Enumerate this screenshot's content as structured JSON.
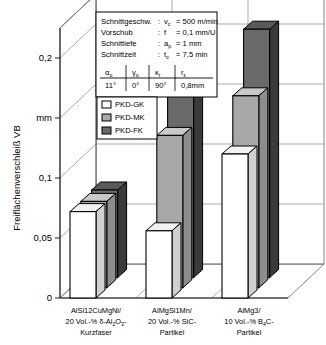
{
  "axes": {
    "y_axis_label": "Freiflächenverschleiß VB",
    "y_unit": "mm",
    "y_ticks": [
      "0",
      "0,05",
      "0,1",
      "mm",
      "0,2"
    ],
    "y_tick_values": [
      0,
      0.05,
      0.1,
      0.15,
      0.2
    ],
    "y_min": 0,
    "y_max": 0.225
  },
  "params_box": {
    "rows": [
      {
        "name": "Schnittgeschw.",
        "sep": ":",
        "sym": "v",
        "sym_sub": "c",
        "value": "= 500 m/min"
      },
      {
        "name": "Vorschub",
        "sep": ":",
        "sym": "f",
        "sym_sub": "",
        "value": "= 0,1 mm/U"
      },
      {
        "name": "Schnittiefe",
        "sep": ":",
        "sym": "a",
        "sym_sub": "p",
        "value": "= 1 mm"
      },
      {
        "name": "Schnittzeit",
        "sep": ":",
        "sym": "t",
        "sym_sub": "c",
        "value": "= 7,5 min"
      }
    ],
    "tool_table": {
      "headers": [
        {
          "sym": "α",
          "sub": "o"
        },
        {
          "sym": "γ",
          "sub": "o"
        },
        {
          "sym": "κ",
          "sub": "r"
        },
        {
          "sym": "r",
          "sub": "ε"
        }
      ],
      "values": [
        "11°",
        "0°",
        "90°",
        "0,8mm"
      ]
    }
  },
  "legend": {
    "items": [
      {
        "label": "PKD-GK",
        "color": "#ffffff"
      },
      {
        "label": "PKD-MK",
        "color": "#a8a8a8"
      },
      {
        "label": "PKD-FK",
        "color": "#6a6a6a"
      }
    ]
  },
  "chart_data": {
    "type": "bar",
    "title": "",
    "xlabel": "",
    "ylabel": "Freiflächenverschleiß VB",
    "yunit": "mm",
    "ylim": [
      0,
      0.225
    ],
    "grid": true,
    "legend_position": "upper-left-inset",
    "categories": [
      "AlSi12CuMgNi/ 20 Vol.-% δ-Al2O3- Kurzfaser",
      "AlMgSi1Mn/ 20 Vol.-% SiC- Partikel",
      "AlMg3/ 10 Vol.-% B4C- Partikel"
    ],
    "series": [
      {
        "name": "PKD-GK",
        "color": "#ffffff",
        "values": [
          0.072,
          0.056,
          0.12
        ]
      },
      {
        "name": "PKD-MK",
        "color": "#a8a8a8",
        "values": [
          0.072,
          0.127,
          0.16
        ]
      },
      {
        "name": "PKD-FK",
        "color": "#6a6a6a",
        "values": [
          0.073,
          0.156,
          0.207
        ]
      }
    ]
  },
  "category_labels": [
    {
      "line1": "AlSi12CuMgNi/",
      "line2_a": "20 Vol.-% δ-Al",
      "line2_sub1": "2",
      "line2_b": "O",
      "line2_sub2": "3",
      "line2_c": "-",
      "line3": "Kurzfaser"
    },
    {
      "line1": "AlMgSi1Mn/",
      "line2_a": "20 Vol.-% SiC-",
      "line2_sub1": "",
      "line2_b": "",
      "line2_sub2": "",
      "line2_c": "",
      "line3": "Partikel"
    },
    {
      "line1": "AlMg3/",
      "line2_a": "10 Vol.-% B",
      "line2_sub1": "4",
      "line2_b": "C",
      "line2_sub2": "",
      "line2_c": "-",
      "line3": "Partikel"
    }
  ]
}
